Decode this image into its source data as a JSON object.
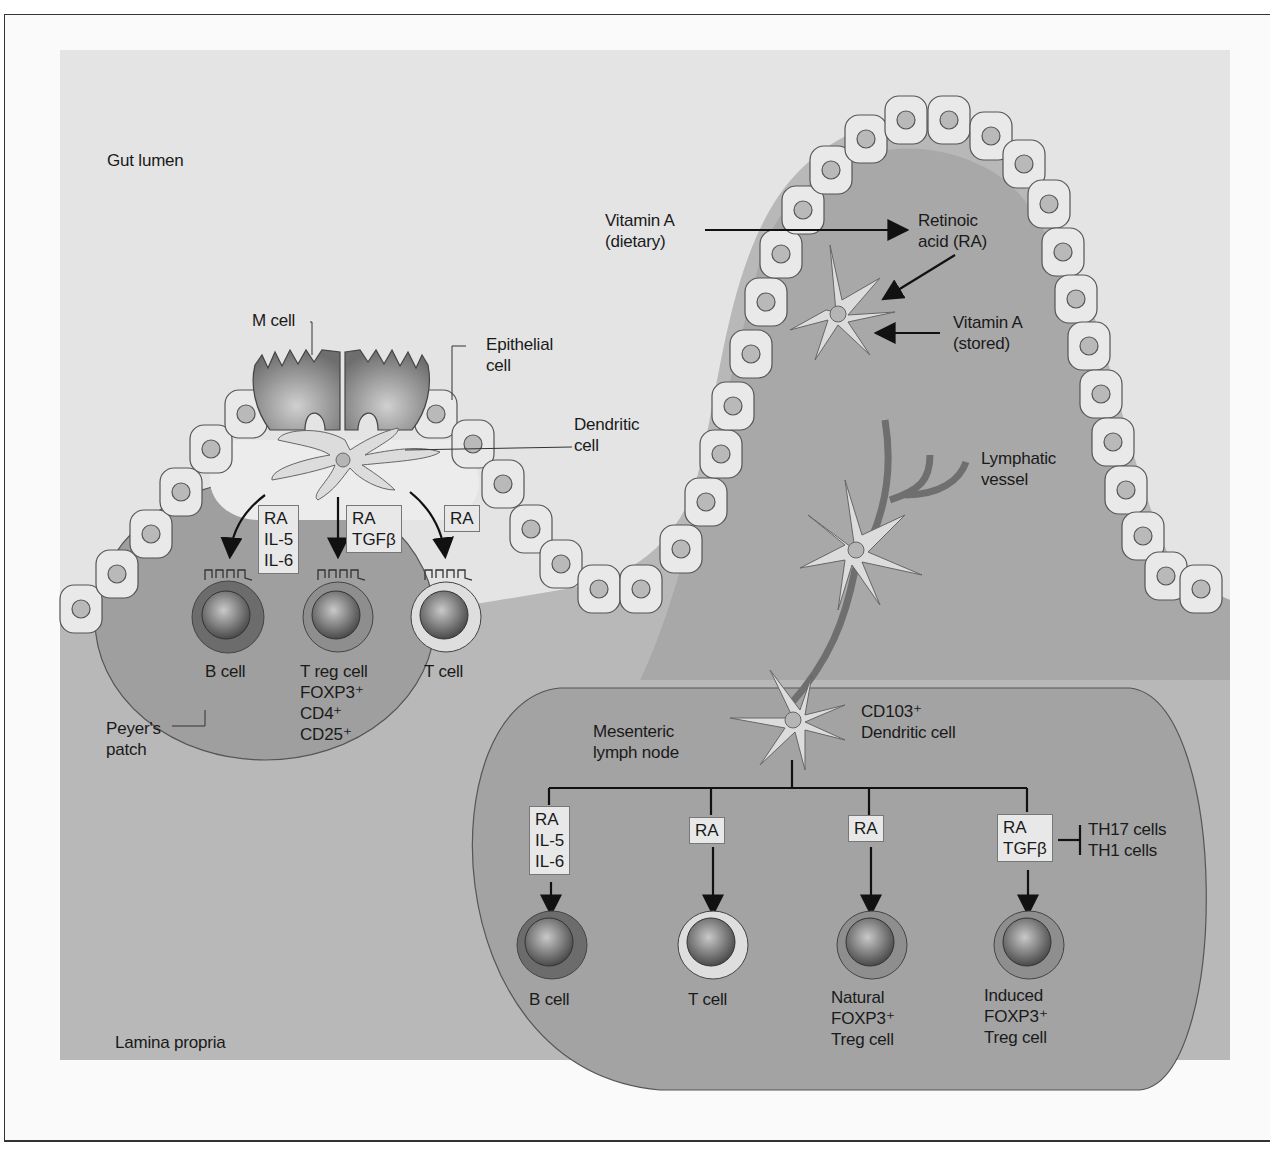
{
  "regions": {
    "gut_lumen": "Gut lumen",
    "lamina_propria": "Lamina propria"
  },
  "peyers_patch": {
    "label": "Peyer's\npatch",
    "m_cell": "M cell",
    "epithelial_cell": "Epithelial\ncell",
    "dendritic_cell": "Dendritic\ncell",
    "signals": [
      {
        "id": "b",
        "text": "RA\nIL-5\nIL-6"
      },
      {
        "id": "treg",
        "text": "RA\nTGFβ"
      },
      {
        "id": "t",
        "text": "RA"
      }
    ],
    "cells": [
      {
        "id": "b",
        "label": "B cell"
      },
      {
        "id": "treg",
        "label": "T reg cell\nFOXP3⁺\nCD4⁺\nCD25⁺"
      },
      {
        "id": "t",
        "label": "T cell"
      }
    ]
  },
  "villus": {
    "vitamin_a_dietary": "Vitamin A\n(dietary)",
    "retinoic_acid": "Retinoic\nacid (RA)",
    "vitamin_a_stored": "Vitamin A\n(stored)",
    "lymphatic_vessel": "Lymphatic\nvessel"
  },
  "lymph_node": {
    "label": "Mesenteric\nlymph node",
    "dendritic_cell": "CD103⁺\nDendritic cell",
    "signals": [
      {
        "id": "b",
        "text": "RA\nIL-5\nIL-6"
      },
      {
        "id": "t",
        "text": "RA"
      },
      {
        "id": "ntreg",
        "text": "RA"
      },
      {
        "id": "itreg",
        "text": "RA\nTGFβ"
      }
    ],
    "inhibits": "TH17 cells\nTH1 cells",
    "cells": [
      {
        "id": "b",
        "label": "B cell"
      },
      {
        "id": "t",
        "label": "T cell"
      },
      {
        "id": "ntreg",
        "label": "Natural\nFOXP3⁺\nTreg cell"
      },
      {
        "id": "itreg",
        "label": "Induced\nFOXP3⁺\nTreg cell"
      }
    ]
  },
  "colors": {
    "background": "#e6e6e6",
    "tissue": "#a9a9a9",
    "patch": "#9c9c9c",
    "epithelial": "#e8e8e8",
    "nucleus": "#b5b5b5"
  }
}
